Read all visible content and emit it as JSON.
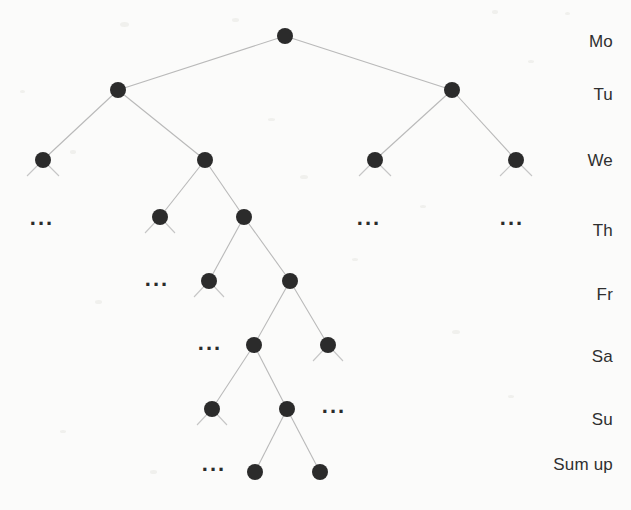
{
  "figure": {
    "width": 631,
    "height": 510,
    "background_color": "#fbfbfa",
    "node_color": "#2b2b2b",
    "edge_color": "#b9b9b9",
    "label_color": "#2f2f2f",
    "node_radius": 8
  },
  "chart_data": {
    "type": "diagram",
    "diagram_kind": "binary-tree",
    "title": "",
    "levels": [
      {
        "index": 0,
        "label": "Mo",
        "y": 36
      },
      {
        "index": 1,
        "label": "Tu",
        "y": 90
      },
      {
        "index": 2,
        "label": "We",
        "y": 160
      },
      {
        "index": 3,
        "label": "Th",
        "y": 217
      },
      {
        "index": 4,
        "label": "Fr",
        "y": 281
      },
      {
        "index": 5,
        "label": "Sa",
        "y": 345
      },
      {
        "index": 6,
        "label": "Su",
        "y": 409
      },
      {
        "index": 7,
        "label": "Sum up",
        "y": 472
      }
    ],
    "row_labels": [
      {
        "text": "Mo",
        "y": 42
      },
      {
        "text": "Tu",
        "y": 95
      },
      {
        "text": "We",
        "y": 161
      },
      {
        "text": "Th",
        "y": 231
      },
      {
        "text": "Fr",
        "y": 295
      },
      {
        "text": "Sa",
        "y": 357
      },
      {
        "text": "Su",
        "y": 420
      },
      {
        "text": "Sum up",
        "y": 465
      }
    ],
    "nodes": [
      {
        "id": "n0",
        "level": 0,
        "x": 285,
        "y": 36
      },
      {
        "id": "n1",
        "level": 1,
        "x": 118,
        "y": 90
      },
      {
        "id": "n2",
        "level": 1,
        "x": 452,
        "y": 90
      },
      {
        "id": "n3",
        "level": 2,
        "x": 43,
        "y": 160
      },
      {
        "id": "n4",
        "level": 2,
        "x": 205,
        "y": 160
      },
      {
        "id": "n5",
        "level": 2,
        "x": 375,
        "y": 160
      },
      {
        "id": "n6",
        "level": 2,
        "x": 516,
        "y": 160
      },
      {
        "id": "n7",
        "level": 3,
        "x": 160,
        "y": 217
      },
      {
        "id": "n8",
        "level": 3,
        "x": 244,
        "y": 217
      },
      {
        "id": "n9",
        "level": 4,
        "x": 209,
        "y": 281
      },
      {
        "id": "n10",
        "level": 4,
        "x": 290,
        "y": 281
      },
      {
        "id": "n11",
        "level": 5,
        "x": 254,
        "y": 345
      },
      {
        "id": "n12",
        "level": 5,
        "x": 328,
        "y": 345
      },
      {
        "id": "n13",
        "level": 6,
        "x": 212,
        "y": 409
      },
      {
        "id": "n14",
        "level": 6,
        "x": 287,
        "y": 409
      },
      {
        "id": "n15",
        "level": 7,
        "x": 255,
        "y": 472
      },
      {
        "id": "n16",
        "level": 7,
        "x": 320,
        "y": 472
      }
    ],
    "edges": [
      {
        "from": "n0",
        "to": "n1"
      },
      {
        "from": "n0",
        "to": "n2"
      },
      {
        "from": "n1",
        "to": "n3"
      },
      {
        "from": "n1",
        "to": "n4"
      },
      {
        "from": "n2",
        "to": "n5"
      },
      {
        "from": "n2",
        "to": "n6"
      },
      {
        "from": "n4",
        "to": "n7"
      },
      {
        "from": "n4",
        "to": "n8"
      },
      {
        "from": "n8",
        "to": "n9"
      },
      {
        "from": "n8",
        "to": "n10"
      },
      {
        "from": "n10",
        "to": "n11"
      },
      {
        "from": "n10",
        "to": "n12"
      },
      {
        "from": "n11",
        "to": "n13"
      },
      {
        "from": "n11",
        "to": "n14"
      },
      {
        "from": "n14",
        "to": "n15"
      },
      {
        "from": "n14",
        "to": "n16"
      }
    ],
    "leaf_stubs": [
      {
        "node": "n3",
        "dx": -16,
        "dy": 16
      },
      {
        "node": "n3",
        "dx": 16,
        "dy": 16
      },
      {
        "node": "n5",
        "dx": -16,
        "dy": 16
      },
      {
        "node": "n5",
        "dx": 16,
        "dy": 16
      },
      {
        "node": "n6",
        "dx": -16,
        "dy": 16
      },
      {
        "node": "n6",
        "dx": 16,
        "dy": 16
      },
      {
        "node": "n7",
        "dx": -15,
        "dy": 16
      },
      {
        "node": "n7",
        "dx": 15,
        "dy": 16
      },
      {
        "node": "n9",
        "dx": -15,
        "dy": 16
      },
      {
        "node": "n9",
        "dx": 15,
        "dy": 16
      },
      {
        "node": "n12",
        "dx": -15,
        "dy": 16
      },
      {
        "node": "n12",
        "dx": 15,
        "dy": 16
      },
      {
        "node": "n13",
        "dx": -15,
        "dy": 16
      },
      {
        "node": "n13",
        "dx": 15,
        "dy": 16
      }
    ],
    "ellipses": [
      {
        "text": "...",
        "x": 42,
        "y": 218,
        "level": 3,
        "note": "continuation under leftmost We node"
      },
      {
        "text": "...",
        "x": 369,
        "y": 218,
        "level": 3,
        "note": "continuation under third We node"
      },
      {
        "text": "...",
        "x": 512,
        "y": 218,
        "level": 3,
        "note": "continuation under rightmost We node"
      },
      {
        "text": "...",
        "x": 157,
        "y": 279,
        "level": 4,
        "note": "continuation under left Th node"
      },
      {
        "text": "...",
        "x": 210,
        "y": 343,
        "level": 5,
        "note": "continuation under left Fr node"
      },
      {
        "text": "...",
        "x": 334,
        "y": 406,
        "level": 6,
        "note": "continuation under right Sa node"
      },
      {
        "text": "...",
        "x": 214,
        "y": 464,
        "level": 7,
        "note": "continuation under left Su node"
      }
    ],
    "counts": {
      "nodes": 17,
      "edges": 16,
      "levels": 8,
      "ellipsis_markers": 7
    }
  }
}
